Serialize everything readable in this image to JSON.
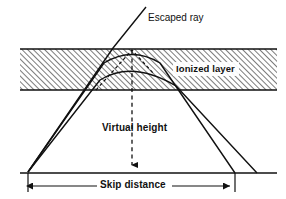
{
  "figure": {
    "kind": "ionospheric-skywave-propagation-diagram",
    "background_color": "#ffffff",
    "line_color": "#111111",
    "hatch_color": "#1a1a1a"
  },
  "labels": {
    "escaped_ray": "Escaped ray",
    "ionized_layer": "Ionized layer",
    "virtual_height": "Virtual height",
    "skip_distance": "Skip distance"
  },
  "layer": {
    "name": "ionized-layer-band",
    "left_x": 20,
    "right_x": 277,
    "top_y": 49,
    "bottom_y": 90,
    "hatch_angle_deg": 45,
    "hatch_spacing_px": 4
  },
  "ground": {
    "name": "ground-line",
    "left_x": 20,
    "right_x": 277,
    "y": 173
  },
  "transmitter": {
    "name": "transmitter-point",
    "x": 28,
    "y": 172
  },
  "rays": [
    {
      "name": "escaped-ray",
      "kind": "straight-escaping",
      "points": [
        [
          28,
          172
        ],
        [
          113,
          48
        ],
        [
          146,
          7
        ]
      ],
      "dashed": false
    },
    {
      "name": "upper-refracted-ray",
      "kind": "refracted-returning",
      "entry": [
        28,
        172
      ],
      "apex": [
        132,
        63
      ],
      "exit": [
        235,
        173
      ],
      "dashed": false
    },
    {
      "name": "lower-refracted-ray",
      "kind": "refracted-returning",
      "entry": [
        28,
        172
      ],
      "apex": [
        132,
        76
      ],
      "exit": [
        257,
        173
      ],
      "dashed": false
    },
    {
      "name": "virtual-path-extension",
      "kind": "dashed-extension",
      "points": [
        [
          90,
          90
        ],
        [
          132,
          50
        ],
        [
          152,
          72
        ]
      ],
      "dashed": true
    }
  ],
  "virtual_height_indicator": {
    "name": "virtual-height-dashed-line",
    "x": 132,
    "top_y": 50,
    "bottom_y": 172,
    "arrow": "down",
    "dashed": true
  },
  "skip_distance_dimension": {
    "name": "skip-distance-dimension",
    "y": 186,
    "left_x": 28,
    "right_x": 235,
    "left_tick_top_y": 173,
    "right_tick_top_y": 173,
    "arrows": "both"
  }
}
